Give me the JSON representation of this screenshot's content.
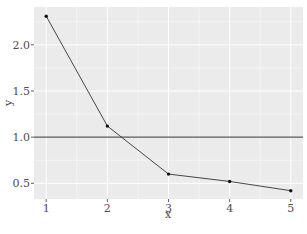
{
  "chart_data": {
    "type": "line",
    "title": "",
    "xlabel": "x",
    "ylabel": "y",
    "x": [
      1,
      2,
      3,
      4,
      5
    ],
    "series": [
      {
        "name": "y",
        "values": [
          2.31,
          1.12,
          0.6,
          0.52,
          0.42
        ]
      }
    ],
    "hline": 1.0,
    "xlim": [
      0.8,
      5.2
    ],
    "ylim": [
      0.33,
      2.41
    ],
    "xticks": [
      "1",
      "2",
      "3",
      "4",
      "5"
    ],
    "yticks": [
      "0.5",
      "1.0",
      "1.5",
      "2.0"
    ],
    "grid": true,
    "colors": {
      "panel": "#ebebeb",
      "grid": "#ffffff",
      "line": "#333333",
      "hline": "#555555"
    }
  },
  "caption": ""
}
